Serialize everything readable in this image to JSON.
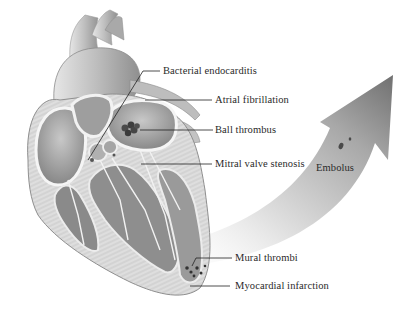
{
  "diagram": {
    "labels": [
      {
        "id": "bacterial-endocarditis",
        "text": "Bacterial endocarditis",
        "x": 163,
        "y": 65
      },
      {
        "id": "atrial-fibrillation",
        "text": "Atrial fibrillation",
        "x": 215,
        "y": 94
      },
      {
        "id": "ball-thrombus",
        "text": "Ball thrombus",
        "x": 215,
        "y": 124
      },
      {
        "id": "mitral-valve-stenosis",
        "text": "Mitral valve stenosis",
        "x": 215,
        "y": 158
      },
      {
        "id": "embolus",
        "text": "Embolus",
        "x": 316,
        "y": 162
      },
      {
        "id": "mural-thrombi",
        "text": "Mural thrombi",
        "x": 235,
        "y": 252
      },
      {
        "id": "myocardial-infarction",
        "text": "Myocardial infarction",
        "x": 235,
        "y": 280
      }
    ],
    "colors": {
      "tissue_light": "#e8e8e8",
      "tissue_mid": "#b5b5b5",
      "tissue_dark": "#6e6e6e",
      "outline": "#555555",
      "arrow_dark": "#7a7a7a",
      "arrow_light": "#ffffff",
      "leader_line": "#222222",
      "thrombus": "#3a3a3a"
    }
  }
}
